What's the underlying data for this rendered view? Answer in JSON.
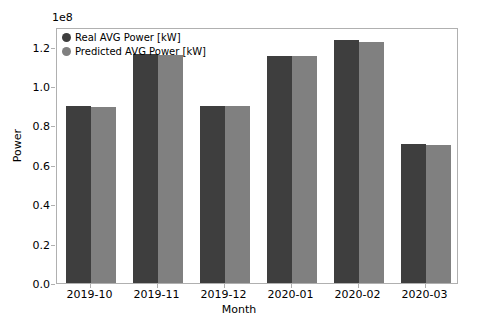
{
  "chart_data": {
    "type": "bar",
    "title": "",
    "xlabel": "Month",
    "ylabel": "Power",
    "y_offset_text": "1e8",
    "categories": [
      "2019-10",
      "2019-11",
      "2019-12",
      "2020-01",
      "2020-02",
      "2020-03"
    ],
    "series": [
      {
        "name": "Real AVG Power [kW]",
        "color": "#3e3e3e",
        "values": [
          90000000,
          116500000,
          90000000,
          115500000,
          123500000,
          70500000
        ]
      },
      {
        "name": "Predicted AVG Power [kW]",
        "color": "#808080",
        "values": [
          89500000,
          116000000,
          90000000,
          115500000,
          122500000,
          70000000
        ]
      }
    ],
    "ylim": [
      0,
      130000000
    ],
    "yticks": [
      0,
      20000000,
      40000000,
      60000000,
      80000000,
      100000000,
      120000000
    ],
    "ytick_labels": [
      "0.0",
      "0.2",
      "0.4",
      "0.6",
      "0.8",
      "1.0",
      "1.2"
    ],
    "grid": false,
    "legend_position": "upper left"
  },
  "legend": {
    "entries": [
      {
        "label": "Real AVG Power [kW]",
        "color": "#3e3e3e"
      },
      {
        "label": "Predicted AVG Power [kW]",
        "color": "#808080"
      }
    ]
  }
}
